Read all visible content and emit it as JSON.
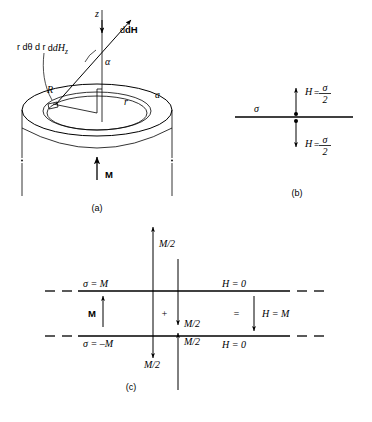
{
  "figure": {
    "panels": [
      {
        "id": "a",
        "caption": "(a)",
        "labels": {
          "z_axis": "z",
          "dHz": "dH",
          "dHz_sub": "z",
          "dH": "dH",
          "alpha": "α",
          "area_element": "r dθ d r",
          "R": "R",
          "a": "a",
          "r": "r",
          "M": "M"
        }
      },
      {
        "id": "b",
        "caption": "(b)",
        "labels": {
          "sigma": "σ",
          "H_above_lhs": "H",
          "H_above_eq": "=",
          "H_above_num": "σ",
          "H_above_den": "2",
          "H_below_lhs": "H",
          "H_below_eq": "=",
          "H_below_num": "σ",
          "H_below_den": "2"
        }
      },
      {
        "id": "c",
        "caption": "(c)",
        "labels": {
          "sigma_top": "σ = M",
          "sigma_bottom": "σ = –M",
          "M": "M",
          "plus": "+",
          "equals": "=",
          "H_top_zero": "H = 0",
          "H_bottom_zero": "H = 0",
          "H_mid": "H = M",
          "M_half_upper_outside": "M/2",
          "M_half_lower_outside": "M/2",
          "M_half_inner_upper": "M/2",
          "M_half_inner_lower": "M/2"
        }
      }
    ]
  }
}
